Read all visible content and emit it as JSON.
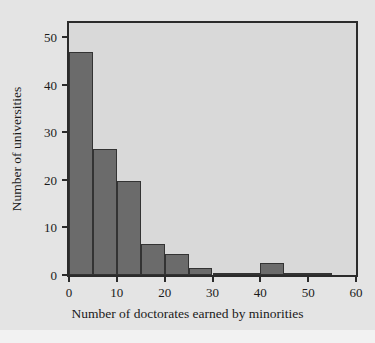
{
  "chart_data": {
    "type": "bar",
    "title": "",
    "subtitle": "",
    "xlabel": "Number of doctorates earned by minorities",
    "ylabel": "Number of universities",
    "xlim": [
      0,
      60
    ],
    "ylim": [
      0,
      53
    ],
    "grid": false,
    "legend": null,
    "bin_width": 5,
    "categories": [
      "0-5",
      "5-10",
      "10-15",
      "15-20",
      "20-25",
      "25-30",
      "30-35",
      "35-40",
      "40-45",
      "45-50",
      "50-55"
    ],
    "bin_starts": [
      0,
      5,
      10,
      15,
      20,
      25,
      30,
      35,
      40,
      45,
      50
    ],
    "values": [
      47,
      26.5,
      19.7,
      6.5,
      4.5,
      1.5,
      0.5,
      0.5,
      2.5,
      0.5,
      0.3
    ],
    "xticks": [
      0,
      10,
      20,
      30,
      40,
      50,
      60
    ],
    "xticklabels": [
      "0",
      "10",
      "20",
      "30",
      "40",
      "50",
      "60"
    ],
    "yticks": [
      0,
      10,
      20,
      30,
      40,
      50
    ],
    "yticklabels": [
      "0",
      "10",
      "20",
      "30",
      "40",
      "50"
    ],
    "colors": {
      "bar_fill": "#6b6b6b",
      "bar_edge": "#333333",
      "plot_background": "#d9d9d9",
      "figure_background": "#e4e4e4",
      "page_background": "#f2f2f2",
      "axis": "#2b2b2b",
      "text": "#1a1a1a"
    }
  },
  "caption": {
    "text": ""
  }
}
